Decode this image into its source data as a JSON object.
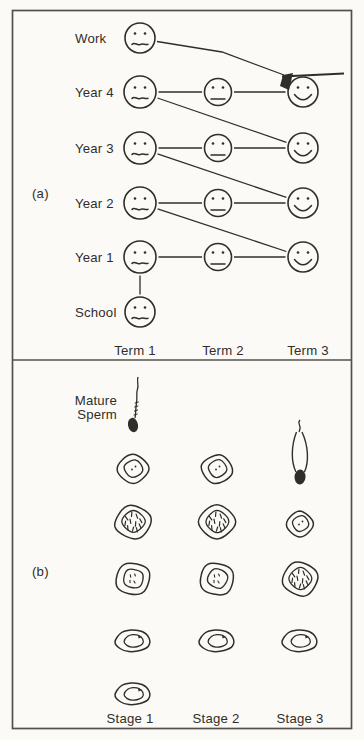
{
  "page": {
    "paper_color": "#fbfaf7",
    "ink_color": "#2f2e2b",
    "border_color": "#53504b"
  },
  "panel_a": {
    "tag": "(a)",
    "term_labels": [
      "Term 1",
      "Term 2",
      "Term 3"
    ],
    "rows": [
      {
        "id": "work",
        "label": "Work",
        "faces": [
          {
            "term": 1,
            "mood": "uneasy"
          }
        ]
      },
      {
        "id": "year4",
        "label": "Year 4",
        "faces": [
          {
            "term": 1,
            "mood": "uneasy"
          },
          {
            "term": 2,
            "mood": "neutral"
          },
          {
            "term": 3,
            "mood": "happy",
            "graduation_cap": true
          }
        ]
      },
      {
        "id": "year3",
        "label": "Year 3",
        "faces": [
          {
            "term": 1,
            "mood": "uneasy"
          },
          {
            "term": 2,
            "mood": "neutral"
          },
          {
            "term": 3,
            "mood": "happy"
          }
        ]
      },
      {
        "id": "year2",
        "label": "Year 2",
        "faces": [
          {
            "term": 1,
            "mood": "uneasy"
          },
          {
            "term": 2,
            "mood": "neutral"
          },
          {
            "term": 3,
            "mood": "happy"
          }
        ]
      },
      {
        "id": "year1",
        "label": "Year 1",
        "faces": [
          {
            "term": 1,
            "mood": "uneasy"
          },
          {
            "term": 2,
            "mood": "neutral"
          },
          {
            "term": 3,
            "mood": "happy"
          }
        ]
      },
      {
        "id": "school",
        "label": "School",
        "faces": [
          {
            "term": 1,
            "mood": "uneasy"
          }
        ]
      }
    ],
    "links": [
      {
        "from": "school.1",
        "to": "year1.1"
      },
      {
        "from": "year1.1",
        "to": "year1.2"
      },
      {
        "from": "year1.2",
        "to": "year1.3"
      },
      {
        "from": "year2.1",
        "to": "year2.2"
      },
      {
        "from": "year2.2",
        "to": "year2.3"
      },
      {
        "from": "year3.1",
        "to": "year3.2"
      },
      {
        "from": "year3.2",
        "to": "year3.3"
      },
      {
        "from": "year4.1",
        "to": "year4.2"
      },
      {
        "from": "year4.2",
        "to": "year4.3"
      },
      {
        "from": "year2.1",
        "to": "year1.3"
      },
      {
        "from": "year3.1",
        "to": "year2.3"
      },
      {
        "from": "year4.1",
        "to": "year3.3"
      },
      {
        "from": "work.1",
        "to": "year4.3"
      }
    ]
  },
  "panel_b": {
    "tag": "(b)",
    "annotation_lines": [
      "Mature",
      "Sperm"
    ],
    "stage_labels": [
      "Stage 1",
      "Stage 2",
      "Stage 3"
    ],
    "mature_sperm_drawing": true,
    "cells": [
      {
        "stage": 1,
        "row": 1,
        "type": "round-cell-dots"
      },
      {
        "stage": 2,
        "row": 1,
        "type": "round-cell-dots"
      },
      {
        "stage": 3,
        "row": 1,
        "type": "elongating-spermatid"
      },
      {
        "stage": 1,
        "row": 2,
        "type": "cell-chromosomes"
      },
      {
        "stage": 2,
        "row": 2,
        "type": "cell-chromosomes"
      },
      {
        "stage": 3,
        "row": 2,
        "type": "round-cell-dots-small"
      },
      {
        "stage": 1,
        "row": 3,
        "type": "round-cell-specks"
      },
      {
        "stage": 2,
        "row": 3,
        "type": "round-cell-specks"
      },
      {
        "stage": 3,
        "row": 3,
        "type": "cell-chromosomes"
      },
      {
        "stage": 1,
        "row": 4,
        "type": "flattened-cell"
      },
      {
        "stage": 2,
        "row": 4,
        "type": "flattened-cell"
      },
      {
        "stage": 3,
        "row": 4,
        "type": "flattened-cell"
      },
      {
        "stage": 1,
        "row": 5,
        "type": "flattened-cell"
      }
    ]
  }
}
